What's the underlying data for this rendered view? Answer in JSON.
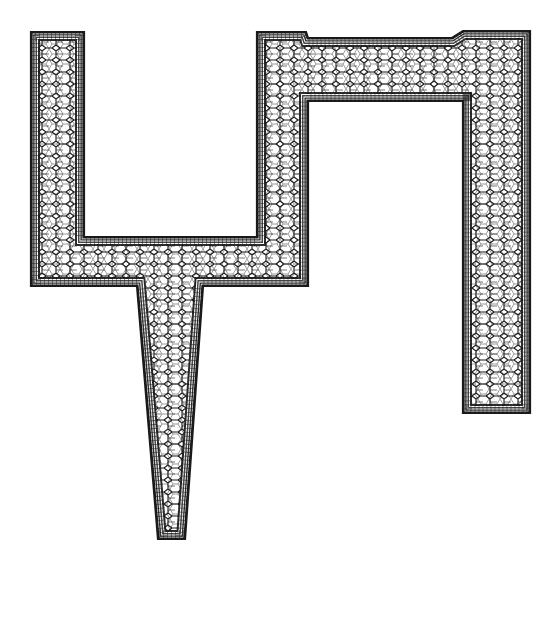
{
  "diagram": {
    "type": "computational-mesh",
    "colors": {
      "background": "#ffffff",
      "mesh_line": "#1a1a1a",
      "cell_fill": "#ffffff"
    },
    "outline_points": [
      [
        31,
        32
      ],
      [
        84,
        32
      ],
      [
        84,
        237
      ],
      [
        257,
        237
      ],
      [
        257,
        32
      ],
      [
        306,
        32
      ],
      [
        308,
        38
      ],
      [
        452,
        38
      ],
      [
        463,
        31
      ],
      [
        530,
        31
      ],
      [
        530,
        413
      ],
      [
        463,
        413
      ],
      [
        463,
        101
      ],
      [
        308,
        101
      ],
      [
        308,
        286
      ],
      [
        203,
        286
      ],
      [
        185,
        539
      ],
      [
        158,
        539
      ],
      [
        137,
        286
      ],
      [
        31,
        286
      ]
    ],
    "regions": [
      {
        "name": "left-vertical-arm",
        "x": 31,
        "y": 32,
        "w": 53,
        "h": 254
      },
      {
        "name": "bottom-horizontal-channel",
        "x": 31,
        "y": 237,
        "w": 277,
        "h": 49
      },
      {
        "name": "middle-vertical-arm",
        "x": 257,
        "y": 32,
        "w": 51,
        "h": 254
      },
      {
        "name": "top-horizontal-channel",
        "x": 257,
        "y": 38,
        "w": 273,
        "h": 63
      },
      {
        "name": "right-vertical-arm",
        "x": 463,
        "y": 31,
        "w": 67,
        "h": 382
      },
      {
        "name": "tapered-outlet",
        "top_left": 137,
        "top_right": 203,
        "bottom_left": 158,
        "bottom_right": 185,
        "top_y": 286,
        "bottom_y": 539
      }
    ]
  }
}
